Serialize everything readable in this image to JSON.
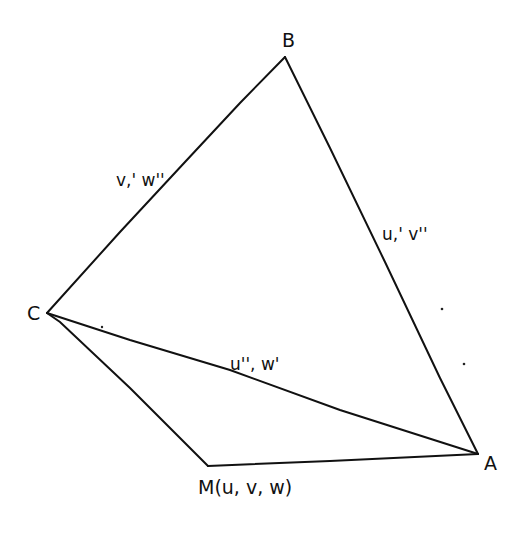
{
  "diagram": {
    "type": "geometric-figure",
    "style": "hand-drawn",
    "vertices": {
      "A": {
        "label": "A",
        "x": 478,
        "y": 454
      },
      "B": {
        "label": "B",
        "x": 285,
        "y": 57
      },
      "C": {
        "label": "C",
        "x": 47,
        "y": 313
      },
      "M": {
        "label": "M(u, v, w)",
        "x": 208,
        "y": 466
      }
    },
    "edges": [
      {
        "from": "B",
        "to": "C",
        "label": "v,' w''"
      },
      {
        "from": "B",
        "to": "A",
        "label": "u,' v''"
      },
      {
        "from": "C",
        "to": "A",
        "label": "u'', w'"
      },
      {
        "from": "C",
        "to": "M",
        "label": ""
      },
      {
        "from": "M",
        "to": "A",
        "label": ""
      }
    ],
    "labels": {
      "vertex_b": "B",
      "vertex_c": "C",
      "vertex_a": "A",
      "vertex_m": "M(u, v, w)",
      "edge_bc": "v,' w''",
      "edge_ba": "u,' v''",
      "edge_ca": "u'', w'"
    },
    "colors": {
      "ink": "#111111",
      "background": "#ffffff"
    }
  }
}
